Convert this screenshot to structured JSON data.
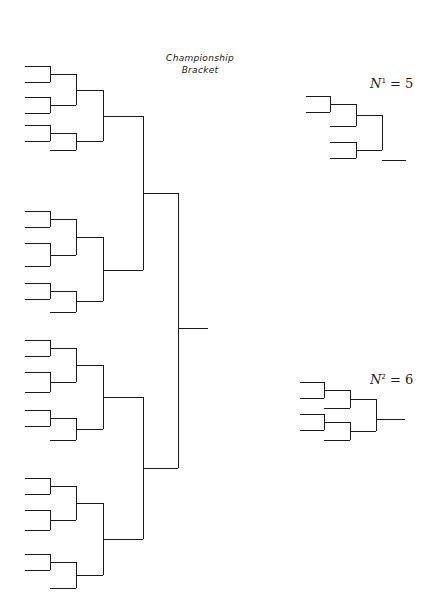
{
  "title": {
    "line1": "Championship",
    "line2": "Bracket"
  },
  "small_brackets": [
    {
      "label_var": "N",
      "label_sup": "1",
      "label_eq": "= 5",
      "entries": 5
    },
    {
      "label_var": "N",
      "label_sup": "2",
      "label_eq": "= 6",
      "entries": 6
    }
  ],
  "main_bracket": {
    "entries": 24,
    "groups": 4,
    "entries_per_group": 6
  },
  "colors": {
    "line": "#1a1a1a",
    "background": "#ffffff"
  }
}
